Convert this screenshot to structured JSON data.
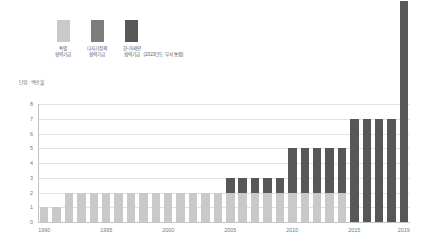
{
  "unit_note": "단위 : 백만 불",
  "legend": {
    "items": [
      {
        "label_line1": "특별",
        "label_line2": "협력기금",
        "color": "#c9c9c9",
        "name": "special-cooperation-fund"
      },
      {
        "label_line1": "다자기정책",
        "label_line2": "협력기금",
        "color": "#7d7d7d",
        "name": "multilateral-policy-fund"
      },
      {
        "label_line1": "한-아세안",
        "label_line2": "협력기금",
        "color": "#575757",
        "name": "korea-asean-fund"
      }
    ],
    "note": "(2023년도 부서 통합)"
  },
  "chart_data": {
    "type": "bar",
    "title": "",
    "xlabel": "",
    "ylabel": "",
    "unit": "단위 : 백만 불",
    "stacked": true,
    "grid": true,
    "legend_position": "top-left",
    "ylim": [
      0,
      8
    ],
    "yticks": [
      0,
      1,
      2,
      3,
      4,
      5,
      6,
      7,
      8
    ],
    "ytick_labels": [
      "0",
      "1",
      "2",
      "3",
      "4",
      "5",
      "6",
      "7",
      "8"
    ],
    "categories": [
      "1990",
      "1991",
      "1992",
      "1993",
      "1994",
      "1995",
      "1996",
      "1997",
      "1998",
      "1999",
      "2000",
      "2001",
      "2002",
      "2003",
      "2004",
      "2005",
      "2006",
      "2007",
      "2008",
      "2009",
      "2010",
      "2011",
      "2012",
      "2013",
      "2014",
      "2015",
      "2016",
      "2017",
      "2018",
      "2019"
    ],
    "xtick_labels": [
      "1990",
      "1995",
      "2000",
      "2005",
      "2010",
      "2015",
      "2019"
    ],
    "xtick_indices": [
      0,
      5,
      10,
      15,
      20,
      25,
      29
    ],
    "series": [
      {
        "name": "특별협력기금",
        "color": "#c9c9c9",
        "values": [
          1,
          1,
          2,
          2,
          2,
          2,
          2,
          2,
          2,
          2,
          2,
          2,
          2,
          2,
          2,
          2,
          2,
          2,
          2,
          2,
          2,
          2,
          2,
          2,
          2,
          0,
          0,
          0,
          0,
          0
        ]
      },
      {
        "name": "다자기정책협력기금",
        "color": "#7d7d7d",
        "values": [
          0,
          0,
          0,
          0,
          0,
          0,
          0,
          0,
          0,
          0,
          0,
          0,
          0,
          0,
          0,
          0,
          0,
          0,
          0,
          0,
          0,
          0,
          0,
          0,
          0,
          0,
          0,
          0,
          0,
          0
        ]
      },
      {
        "name": "한-아세안협력기금",
        "color": "#575757",
        "values": [
          0,
          0,
          0,
          0,
          0,
          0,
          0,
          0,
          0,
          0,
          0,
          0,
          0,
          0,
          0,
          1,
          1,
          1,
          1,
          1,
          3,
          3,
          3,
          3,
          3,
          7,
          7,
          7,
          7,
          15
        ]
      }
    ],
    "totals": [
      1,
      1,
      2,
      2,
      2,
      2,
      2,
      2,
      2,
      2,
      2,
      2,
      2,
      2,
      2,
      3,
      3,
      3,
      3,
      3,
      5,
      5,
      5,
      5,
      5,
      7,
      7,
      7,
      7,
      15
    ]
  }
}
